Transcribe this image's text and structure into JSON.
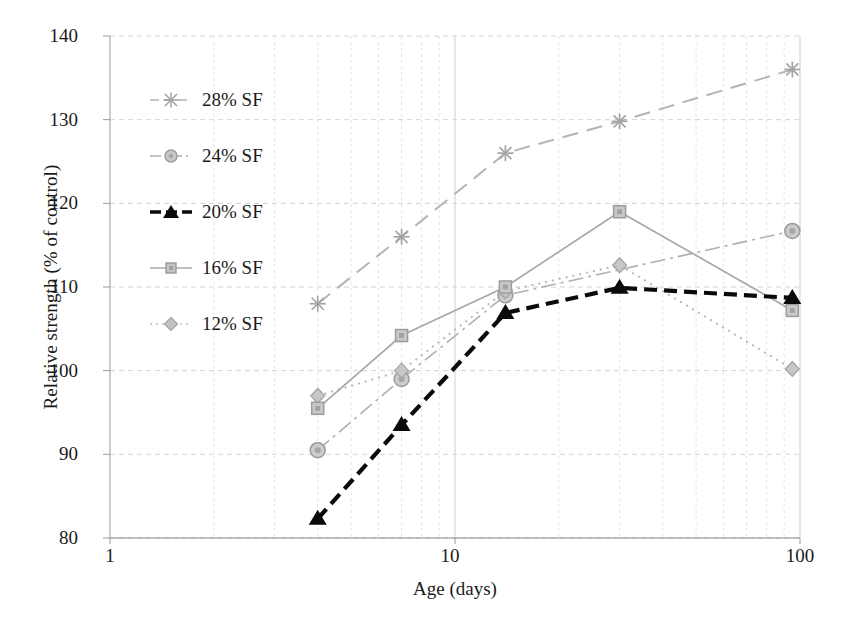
{
  "chart_data": {
    "type": "line",
    "title": "",
    "xlabel": "Age (days)",
    "ylabel": "Relative strength (% of control)",
    "xscale": "log",
    "xlim": [
      1,
      100
    ],
    "ylim": [
      80,
      140
    ],
    "xticks": [
      "1",
      "10",
      "100"
    ],
    "xtick_values": [
      1,
      10,
      100
    ],
    "yticks": [
      "80",
      "90",
      "100",
      "110",
      "120",
      "130",
      "140"
    ],
    "ytick_values": [
      80,
      90,
      100,
      110,
      120,
      130,
      140
    ],
    "grid": true,
    "legend_position": "upper left",
    "x": [
      4,
      7,
      14,
      30,
      95
    ],
    "series": [
      {
        "name": "28% SF",
        "color": "#b4b4b4",
        "marker": "star",
        "dash": "long-dash",
        "values": [
          108.0,
          116.0,
          126.0,
          129.8,
          136.0
        ]
      },
      {
        "name": "24% SF",
        "color": "#b0b0b0",
        "marker": "circle",
        "dash": "dash-dot",
        "values": [
          90.5,
          99.0,
          109.0,
          null,
          116.7
        ]
      },
      {
        "name": "20% SF",
        "color": "#0a0a0a",
        "marker": "triangle",
        "dash": "dash",
        "values": [
          82.3,
          93.5,
          106.9,
          109.9,
          108.7
        ]
      },
      {
        "name": "16% SF",
        "color": "#a8a8a8",
        "marker": "square",
        "dash": "solid",
        "values": [
          95.5,
          104.2,
          110.0,
          119.0,
          107.2
        ]
      },
      {
        "name": "12% SF",
        "color": "#b8b8b8",
        "marker": "diamond",
        "dash": "dotted",
        "values": [
          97.0,
          100.0,
          109.5,
          112.6,
          100.2
        ]
      }
    ]
  },
  "legend": {
    "items": [
      {
        "label": "28% SF"
      },
      {
        "label": "24% SF"
      },
      {
        "label": "20% SF"
      },
      {
        "label": "16% SF"
      },
      {
        "label": "12% SF"
      }
    ]
  },
  "axes": {
    "x_label": "Age (days)",
    "y_label": "Relative strength (% of control)",
    "x_ticks": [
      "1",
      "10",
      "100"
    ],
    "y_ticks": [
      "140",
      "130",
      "120",
      "110",
      "100",
      "90",
      "80"
    ]
  }
}
